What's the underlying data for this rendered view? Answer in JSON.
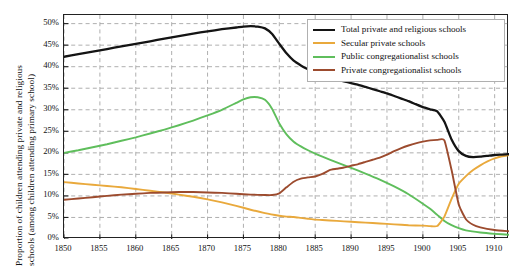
{
  "axes": {
    "ylabel_line1": "Proportion of children attending private and religious",
    "ylabel_line2": "schools (among children attending primary school)",
    "yticks": [
      "0%",
      "5%",
      "10%",
      "15%",
      "20%",
      "25%",
      "30%",
      "35%",
      "40%",
      "45%",
      "50%"
    ],
    "xticks": [
      "1850",
      "1855",
      "1860",
      "1865",
      "1870",
      "1875",
      "1880",
      "1885",
      "1890",
      "1895",
      "1900",
      "1905",
      "1910"
    ]
  },
  "legend": {
    "items": [
      {
        "label": "Total private and religious schools",
        "color": "#141414"
      },
      {
        "label": "Secular private schools",
        "color": "#E9A93C"
      },
      {
        "label": "Public congregationalist schools",
        "color": "#5FBE5C"
      },
      {
        "label": "Private congregationalist schools",
        "color": "#9C4B2E"
      }
    ]
  },
  "chart_data": {
    "type": "line",
    "title": "",
    "xlabel": "",
    "ylabel": "Proportion of children attending private and religious schools (among children attending primary school)",
    "xlim": [
      1850,
      1912
    ],
    "ylim": [
      0,
      52
    ],
    "grid": true,
    "legend_position": "top-right",
    "ytick_values": [
      0,
      5,
      10,
      15,
      20,
      25,
      30,
      35,
      40,
      45,
      50
    ],
    "xtick_values": [
      1850,
      1855,
      1860,
      1865,
      1870,
      1875,
      1880,
      1885,
      1890,
      1895,
      1900,
      1905,
      1910
    ],
    "series": [
      {
        "name": "Total private and religious schools",
        "color": "#141414",
        "x": [
          1850,
          1852,
          1854,
          1856,
          1858,
          1860,
          1862,
          1864,
          1866,
          1868,
          1870,
          1872,
          1874,
          1875,
          1876,
          1877,
          1878,
          1879,
          1880,
          1881,
          1882,
          1883,
          1884,
          1885,
          1886,
          1887,
          1888,
          1889,
          1890,
          1891,
          1892,
          1893,
          1894,
          1895,
          1896,
          1897,
          1898,
          1899,
          1900,
          1901,
          1902,
          1903,
          1904,
          1905,
          1906,
          1907,
          1908,
          1909,
          1910,
          1911,
          1912
        ],
        "y": [
          42.3,
          42.9,
          43.5,
          44.1,
          44.7,
          45.3,
          45.9,
          46.5,
          47.1,
          47.7,
          48.2,
          48.7,
          49.1,
          49.3,
          49.4,
          49.3,
          48.9,
          47.6,
          45.3,
          43.1,
          41.4,
          40.3,
          39.4,
          38.6,
          37.9,
          37.4,
          37.0,
          36.6,
          36.2,
          35.8,
          35.3,
          34.8,
          34.3,
          33.8,
          33.2,
          32.6,
          32.0,
          31.3,
          30.6,
          30.1,
          29.6,
          27.2,
          23.1,
          20.4,
          19.3,
          19.0,
          19.1,
          19.3,
          19.5,
          19.6,
          19.7
        ]
      },
      {
        "name": "Secular private schools",
        "color": "#E9A93C",
        "x": [
          1850,
          1852,
          1854,
          1856,
          1858,
          1860,
          1862,
          1864,
          1866,
          1868,
          1870,
          1872,
          1874,
          1876,
          1878,
          1880,
          1881,
          1882,
          1883,
          1884,
          1885,
          1886,
          1888,
          1890,
          1892,
          1894,
          1896,
          1898,
          1900,
          1901,
          1902,
          1903,
          1904,
          1905,
          1906,
          1907,
          1908,
          1909,
          1910,
          1911,
          1912
        ],
        "y": [
          13.2,
          12.9,
          12.6,
          12.3,
          12.0,
          11.6,
          11.2,
          10.8,
          10.3,
          9.8,
          9.2,
          8.5,
          7.7,
          6.8,
          6.0,
          5.4,
          5.2,
          5.1,
          4.9,
          4.7,
          4.5,
          4.4,
          4.2,
          4.0,
          3.8,
          3.6,
          3.4,
          3.2,
          3.1,
          3.0,
          3.0,
          5.2,
          9.3,
          12.8,
          14.6,
          16.0,
          17.1,
          18.0,
          18.7,
          19.2,
          19.5
        ]
      },
      {
        "name": "Public congregationalist schools",
        "color": "#5FBE5C",
        "x": [
          1850,
          1852,
          1854,
          1856,
          1858,
          1860,
          1862,
          1864,
          1866,
          1868,
          1870,
          1872,
          1874,
          1875,
          1876,
          1877,
          1878,
          1879,
          1880,
          1881,
          1882,
          1883,
          1884,
          1885,
          1886,
          1888,
          1890,
          1892,
          1894,
          1896,
          1898,
          1900,
          1901,
          1902,
          1903,
          1904,
          1905,
          1906,
          1908,
          1910,
          1912
        ],
        "y": [
          20.0,
          20.6,
          21.3,
          22.0,
          22.8,
          23.6,
          24.5,
          25.4,
          26.4,
          27.5,
          28.7,
          30.0,
          31.6,
          32.4,
          32.9,
          32.9,
          32.3,
          30.2,
          26.8,
          24.3,
          22.6,
          21.5,
          20.6,
          19.8,
          19.1,
          17.8,
          16.5,
          15.2,
          13.8,
          12.2,
          10.4,
          8.2,
          7.0,
          5.6,
          4.2,
          3.2,
          2.5,
          2.0,
          1.5,
          1.2,
          1.0
        ]
      },
      {
        "name": "Private congregationalist schools",
        "color": "#9C4B2E",
        "x": [
          1850,
          1852,
          1854,
          1856,
          1858,
          1860,
          1862,
          1864,
          1866,
          1868,
          1870,
          1872,
          1874,
          1876,
          1878,
          1879,
          1880,
          1881,
          1882,
          1883,
          1884,
          1885,
          1886,
          1887,
          1888,
          1889,
          1890,
          1891,
          1892,
          1893,
          1894,
          1895,
          1896,
          1897,
          1898,
          1899,
          1900,
          1901,
          1902,
          1903,
          1904,
          1905,
          1906,
          1907,
          1908,
          1910,
          1912
        ],
        "y": [
          9.1,
          9.4,
          9.7,
          10.0,
          10.3,
          10.5,
          10.7,
          10.8,
          10.9,
          10.9,
          10.8,
          10.7,
          10.5,
          10.3,
          10.2,
          10.2,
          10.6,
          12.0,
          13.3,
          14.0,
          14.3,
          14.5,
          15.1,
          16.0,
          16.3,
          16.6,
          17.0,
          17.4,
          17.9,
          18.4,
          18.9,
          19.6,
          20.4,
          21.1,
          21.7,
          22.2,
          22.6,
          22.9,
          23.0,
          22.9,
          16.0,
          8.0,
          4.6,
          3.3,
          2.7,
          2.1,
          1.8
        ]
      }
    ]
  }
}
